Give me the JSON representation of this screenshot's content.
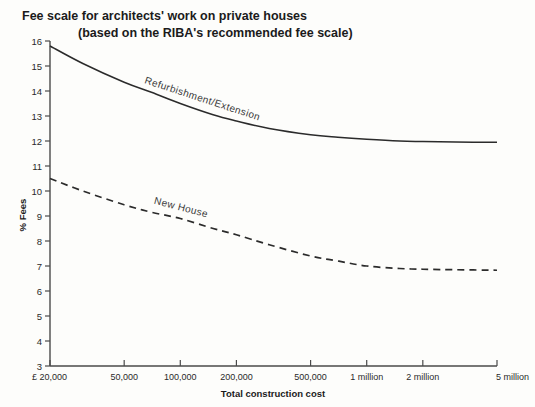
{
  "chart_data": {
    "type": "line",
    "title": "Fee scale for architects' work on private houses",
    "subtitle": "(based on the RIBA's recommended fee scale)",
    "xlabel": "Total construction cost",
    "ylabel": "% Fees",
    "xscale": "log",
    "xlim": [
      20000,
      5000000
    ],
    "ylim": [
      3,
      16
    ],
    "grid": false,
    "legend": "inline-curve-labels",
    "xtick_labels": [
      "£ 20,000",
      "50,000",
      "100,000",
      "200,000",
      "500,000",
      "1 million",
      "2 million",
      "5 million"
    ],
    "xtick_values": [
      20000,
      50000,
      100000,
      200000,
      500000,
      1000000,
      2000000,
      5000000
    ],
    "ytick_labels": [
      "3",
      "4",
      "5",
      "6",
      "7",
      "8",
      "9",
      "10",
      "11",
      "12",
      "13",
      "14",
      "15",
      "16"
    ],
    "ytick_values": [
      3,
      4,
      5,
      6,
      7,
      8,
      9,
      10,
      11,
      12,
      13,
      14,
      15,
      16
    ],
    "series": [
      {
        "name": "Refurbishment/Extension",
        "style": "solid",
        "color": "#2b2b2b",
        "x": [
          20000,
          30000,
          50000,
          70000,
          100000,
          150000,
          200000,
          300000,
          500000,
          700000,
          1000000,
          1500000,
          2000000,
          3000000,
          5000000
        ],
        "values": [
          15.8,
          15.1,
          14.35,
          13.95,
          13.5,
          13.05,
          12.8,
          12.5,
          12.25,
          12.15,
          12.07,
          12.0,
          11.98,
          11.96,
          11.95
        ]
      },
      {
        "name": "New House",
        "style": "dashed",
        "color": "#2b2b2b",
        "x": [
          20000,
          30000,
          50000,
          70000,
          100000,
          150000,
          200000,
          300000,
          500000,
          700000,
          1000000,
          1500000,
          2000000,
          3000000,
          5000000
        ],
        "values": [
          10.5,
          10.0,
          9.45,
          9.15,
          8.9,
          8.5,
          8.25,
          7.85,
          7.4,
          7.2,
          7.0,
          6.9,
          6.87,
          6.85,
          6.83
        ]
      }
    ]
  }
}
